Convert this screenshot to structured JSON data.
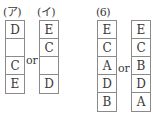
{
  "groups": {
    "a": {
      "label_left": "(ア)",
      "label_right": "(イ)",
      "left_cells": [
        "D",
        "",
        "C",
        "E"
      ],
      "right_cells": [
        "E",
        "C",
        "",
        "D"
      ],
      "connector": "or"
    },
    "six": {
      "label": "(6)",
      "left_cells": [
        "E",
        "C",
        "A",
        "D",
        "B"
      ],
      "right_cells": [
        "E",
        "C",
        "B",
        "D",
        "A"
      ],
      "connector": "or"
    }
  }
}
